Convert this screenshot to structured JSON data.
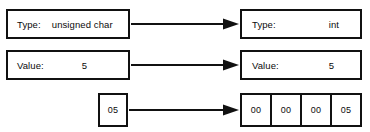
{
  "diagram": {
    "stroke_color": "#111111",
    "background_color": "#ffffff",
    "source": {
      "type_label": "Type:",
      "type_value": "unsigned char",
      "value_label": "Value:",
      "value_value": "5",
      "bytes": [
        "05"
      ]
    },
    "destination": {
      "type_label": "Type:",
      "type_value": "int",
      "value_label": "Value:",
      "value_value": "5",
      "bytes": [
        "00",
        "00",
        "00",
        "05"
      ]
    },
    "arrows": [
      {
        "name": "type-arrow",
        "direction": "right"
      },
      {
        "name": "value-arrow",
        "direction": "right"
      },
      {
        "name": "bytes-arrow",
        "direction": "right"
      }
    ]
  }
}
